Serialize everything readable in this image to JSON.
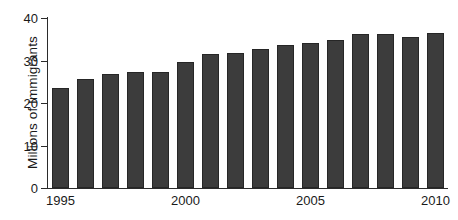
{
  "chart_data": {
    "type": "bar",
    "title": "",
    "xlabel": "",
    "ylabel": "Millions of Immigrants",
    "ylim": [
      0,
      40
    ],
    "yticks": [
      0,
      10,
      20,
      30,
      40
    ],
    "ytick_labels": [
      "0",
      "10",
      "20",
      "30",
      "40"
    ],
    "grid": false,
    "legend": false,
    "bar_color": "#3c3c3c",
    "bar_edge_color": "#262626",
    "axis_color": "#2b2b2b",
    "categories": [
      "1995",
      "1996",
      "1997",
      "1998",
      "1999",
      "1'+'000",
      "2001",
      "2002",
      "2003",
      "2004",
      "2005",
      "2006",
      "2007",
      "2008",
      "2009",
      "2010"
    ],
    "x": [
      1995,
      1996,
      1997,
      1998,
      1999,
      2000,
      2001,
      2002,
      2003,
      2004,
      2005,
      2006,
      2007,
      2008,
      2009,
      2010
    ],
    "values": [
      23.5,
      25.6,
      26.8,
      27.3,
      27.3,
      29.6,
      31.5,
      31.8,
      32.6,
      33.6,
      34.2,
      34.8,
      36.2,
      36.2,
      35.5,
      36.4
    ],
    "xtick_labels": [
      {
        "label": "1995",
        "index": 0
      },
      {
        "label": "2000",
        "index": 5
      },
      {
        "label": "2005",
        "index": 10
      },
      {
        "label": "2010",
        "index": 15
      }
    ]
  }
}
